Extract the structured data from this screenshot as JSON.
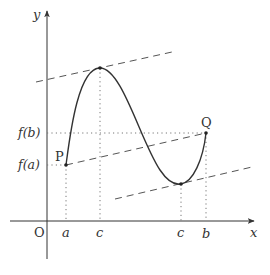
{
  "diagram": {
    "axes": {
      "x_label": "x",
      "y_label": "y",
      "origin_label": "O"
    },
    "x_ticks": [
      {
        "label": "a",
        "px": 66
      },
      {
        "label": "c",
        "px": 100
      },
      {
        "label": "c",
        "px": 181
      },
      {
        "label": "b",
        "px": 206
      }
    ],
    "y_ticks": [
      {
        "label": "f(b)",
        "py": 133
      },
      {
        "label": "f(a)",
        "py": 165
      }
    ],
    "points": [
      {
        "label": "P",
        "px": 66,
        "py": 165
      },
      {
        "label": "Q",
        "px": 206,
        "py": 133
      },
      {
        "label": "",
        "px": 100,
        "py": 68
      },
      {
        "label": "",
        "px": 181,
        "py": 184
      }
    ],
    "lines": {
      "secant": {
        "style": "dashed",
        "from": [
          66,
          165
        ],
        "to": [
          206,
          133
        ]
      },
      "tangent_upper": {
        "style": "dashed",
        "from": [
          36,
          82
        ],
        "to": [
          172,
          52
        ]
      },
      "tangent_lower": {
        "style": "dashed",
        "from": [
          115,
          199
        ],
        "to": [
          252,
          167
        ]
      }
    },
    "colors": {
      "stroke": "#333333",
      "dash": "#555555",
      "dot": "#777777"
    }
  },
  "labels": {
    "y_axis": "y",
    "x_axis": "x",
    "origin": "O",
    "tick_a": "a",
    "tick_c1": "c",
    "tick_c2": "c",
    "tick_b": "b",
    "f_b": "f(b)",
    "f_a": "f(a)",
    "point_P": "P",
    "point_Q": "Q"
  }
}
